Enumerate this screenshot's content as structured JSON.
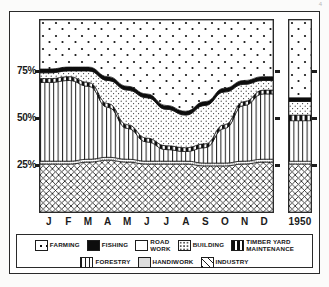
{
  "corner_mark": "4",
  "axis": {
    "y_ticks": [
      {
        "label": "75%",
        "value": 75
      },
      {
        "label": "50%",
        "value": 50
      },
      {
        "label": "25%",
        "value": 25
      }
    ],
    "x_labels": [
      "J",
      "F",
      "M",
      "A",
      "M",
      "J",
      "J",
      "A",
      "S",
      "O",
      "N",
      "D"
    ],
    "summary_label": "1950"
  },
  "legend": {
    "row1": [
      {
        "key": "farming",
        "label": "FARMING"
      },
      {
        "key": "fishing",
        "label": "FISHING"
      },
      {
        "key": "roadwork",
        "label": "ROAD\nWORK"
      },
      {
        "key": "building",
        "label": "BUILDING"
      },
      {
        "key": "timber",
        "label": "TIMBER YARD\nMAINTENANCE"
      }
    ],
    "row2": [
      {
        "key": "forestry",
        "label": "FORESTRY"
      },
      {
        "key": "handiwork",
        "label": "HANDIWORK"
      },
      {
        "key": "industry",
        "label": "INDUSTRY"
      }
    ]
  },
  "chart_data": {
    "type": "area",
    "title": "",
    "subtitle": "",
    "xlabel": "",
    "ylabel": "",
    "ylim": [
      0,
      100
    ],
    "grid": false,
    "legend_position": "bottom",
    "stacking": "normal",
    "x": [
      "J",
      "F",
      "M",
      "A",
      "M",
      "J",
      "J",
      "A",
      "S",
      "O",
      "N",
      "D"
    ],
    "categories": [
      "J",
      "F",
      "M",
      "A",
      "M",
      "J",
      "J",
      "A",
      "S",
      "O",
      "N",
      "D"
    ],
    "series": [
      {
        "name": "Industry",
        "key": "industry",
        "values": [
          25,
          25,
          26,
          27,
          26,
          25,
          25,
          25,
          24,
          24,
          25,
          26
        ]
      },
      {
        "name": "Handiwork",
        "key": "handiwork",
        "values": [
          1.5,
          1.5,
          1.5,
          1.5,
          1.5,
          1.5,
          1.5,
          1.5,
          1.5,
          1.5,
          1.5,
          1.5
        ]
      },
      {
        "name": "Forestry",
        "key": "forestry",
        "values": [
          41,
          42,
          38,
          26,
          16,
          10,
          6,
          5,
          8,
          18,
          29,
          34
        ]
      },
      {
        "name": "Timber yard maintenance",
        "key": "timber",
        "values": [
          2,
          2,
          2,
          2,
          2,
          2,
          2,
          2,
          2,
          2,
          2,
          2
        ]
      },
      {
        "name": "Building",
        "key": "building",
        "values": [
          3,
          3,
          6,
          12,
          18,
          21,
          19,
          17,
          20,
          17,
          9,
          5
        ]
      },
      {
        "name": "Road work",
        "key": "roadwork",
        "values": [
          0,
          0,
          0,
          0,
          0,
          0,
          0,
          0,
          0,
          0,
          0,
          0
        ]
      },
      {
        "name": "Fishing",
        "key": "fishing",
        "values": [
          2,
          2,
          2,
          2,
          2,
          2,
          2,
          2,
          2,
          2,
          2,
          2
        ]
      },
      {
        "name": "Farming",
        "key": "farming",
        "values": [
          25.5,
          24.5,
          24.5,
          29.5,
          34.5,
          38.5,
          44.5,
          47.5,
          42.5,
          37.5,
          31.5,
          29.5
        ]
      }
    ],
    "cumulative_top_boundaries": {
      "industry": [
        25,
        25,
        26,
        27,
        26,
        25,
        25,
        25,
        24,
        24,
        25,
        26
      ],
      "handiwork": [
        26.5,
        26.5,
        27.5,
        28.5,
        27.5,
        26.5,
        26.5,
        26.5,
        25.5,
        25.5,
        26.5,
        27.5
      ],
      "forestry": [
        67.5,
        68.5,
        65.5,
        54.5,
        43.5,
        36.5,
        32.5,
        31.5,
        33.5,
        43.5,
        55.5,
        61.5
      ],
      "timber": [
        69.5,
        70.5,
        67.5,
        56.5,
        45.5,
        38.5,
        34.5,
        33.5,
        35.5,
        45.5,
        57.5,
        63.5
      ],
      "building": [
        72.5,
        73.5,
        73.5,
        68.5,
        63.5,
        59.5,
        53.5,
        50.5,
        55.5,
        62.5,
        66.5,
        68.5
      ],
      "fishing": [
        74.5,
        75.5,
        75.5,
        70.5,
        65.5,
        61.5,
        55.5,
        52.5,
        57.5,
        64.5,
        68.5,
        70.5
      ],
      "farming": [
        100,
        100,
        100,
        100,
        100,
        100,
        100,
        100,
        100,
        100,
        100,
        100
      ]
    },
    "summary_bar": {
      "label": "1950",
      "stack": [
        {
          "name": "Industry",
          "key": "industry",
          "value": 25
        },
        {
          "name": "Handiwork",
          "key": "handiwork",
          "value": 1.5
        },
        {
          "name": "Forestry",
          "key": "forestry",
          "value": 21
        },
        {
          "name": "Timber yard maintenance",
          "key": "timber",
          "value": 3
        },
        {
          "name": "Building",
          "key": "building",
          "value": 7
        },
        {
          "name": "Fishing",
          "key": "fishing",
          "value": 2
        },
        {
          "name": "Farming",
          "key": "farming",
          "value": 40.5
        }
      ]
    }
  }
}
